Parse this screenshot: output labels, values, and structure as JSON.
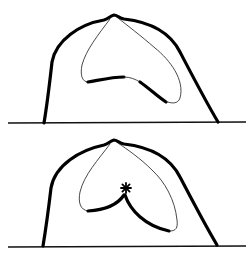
{
  "figure": {
    "panels": [
      {
        "id": "top",
        "description": "Dome outline with inner kidney-shaped loop",
        "marker": null
      },
      {
        "id": "bottom",
        "description": "Dome outline with inner heart-shaped loop meeting at a central star marker",
        "marker": "asterisk"
      }
    ],
    "colors": {
      "stroke": "#000000",
      "background": "#ffffff"
    }
  }
}
